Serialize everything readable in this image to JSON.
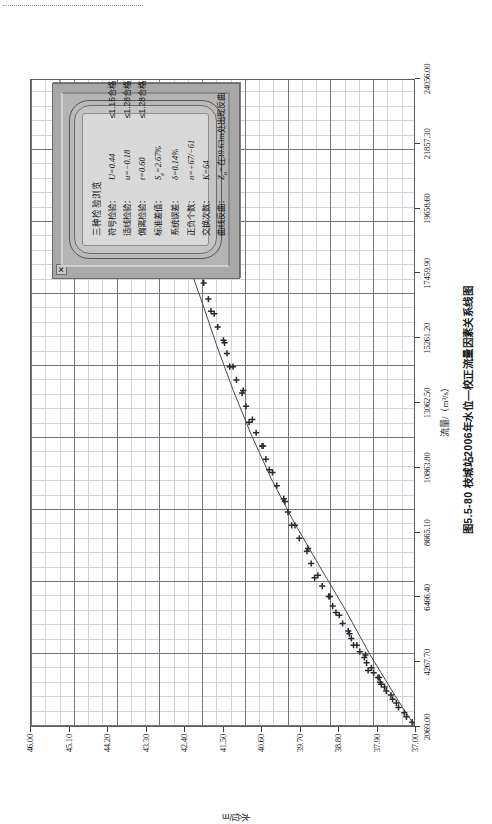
{
  "figure": {
    "caption": "图5.5-80  枝城站2006年水位—校正流量因素关系线图",
    "x_axis_title": "流量/（m³/s）",
    "y_axis_title": "水位/m"
  },
  "dialog": {
    "close_label": "✕",
    "title": "三种检验浏览",
    "rows": [
      {
        "label": "符号检验：",
        "value": "U=0.44",
        "criterion": "≤1.15合格"
      },
      {
        "label": "适线检验：",
        "value": "u=−0.18",
        "criterion": "≤1.28合格"
      },
      {
        "label": "偏离检验：",
        "value": "t=0.60",
        "criterion": "≤1.28合格"
      },
      {
        "label": "标准差值：",
        "value": "Se=2.67%",
        "criterion": ""
      },
      {
        "label": "系统误差：",
        "value": "δ=0.14%",
        "criterion": ""
      },
      {
        "label": "正负个数：",
        "value": "n=+67/−61",
        "criterion": ""
      },
      {
        "label": "交换次数：",
        "value": "K=64",
        "criterion": ""
      },
      {
        "label": "曲线反曲：",
        "value": "Zo=在39.63m处出现反曲",
        "criterion": ""
      }
    ]
  },
  "chart_data": {
    "type": "scatter",
    "title": "图5.5-80  枝城站2006年水位—校正流量因素关系线图",
    "xlabel": "流量/（m³/s）",
    "ylabel": "水位/m",
    "xlim": [
      2069.0,
      24056.0
    ],
    "ylim": [
      37.0,
      46.0
    ],
    "grid": true,
    "legend": null,
    "xticks": [
      "2069.00",
      "4267.70",
      "6466.40",
      "8665.10",
      "10863.80",
      "13062.50",
      "15261.20",
      "17459.90",
      "19658.60",
      "21857.30",
      "24056.00"
    ],
    "yticks": [
      "37.00",
      "37.90",
      "38.80",
      "39.70",
      "40.60",
      "41.50",
      "42.40",
      "43.30",
      "44.20",
      "45.10",
      "46.00"
    ],
    "series": [
      {
        "name": "实测点",
        "marker": "plus",
        "points_x": [
          2200,
          2380,
          2520,
          2700,
          2850,
          2980,
          3120,
          3260,
          3400,
          3560,
          3720,
          3880,
          4050,
          4220,
          4400,
          4600,
          4820,
          5050,
          5300,
          5560,
          5840,
          6150,
          6480,
          6830,
          7200,
          7600,
          8020,
          8460,
          8900,
          9350,
          9800,
          10250,
          10700,
          11150,
          11600,
          12050,
          12500,
          12950,
          13400,
          13850,
          14300,
          14750,
          15200,
          15650,
          16100,
          16600,
          17150,
          17750,
          18400,
          19100,
          19900,
          20800,
          21900
        ],
        "points_y": [
          37.08,
          37.18,
          37.26,
          37.36,
          37.44,
          37.51,
          37.58,
          37.65,
          37.72,
          37.8,
          37.88,
          37.95,
          38.03,
          38.11,
          38.19,
          38.28,
          38.38,
          38.47,
          38.57,
          38.68,
          38.79,
          38.91,
          39.03,
          39.15,
          39.28,
          39.42,
          39.55,
          39.69,
          39.82,
          39.96,
          40.09,
          40.22,
          40.35,
          40.47,
          40.59,
          40.71,
          40.83,
          40.94,
          41.06,
          41.17,
          41.28,
          41.39,
          41.5,
          41.6,
          41.71,
          41.83,
          41.97,
          42.12,
          42.29,
          42.49,
          42.73,
          43.01,
          43.4
        ]
      }
    ],
    "fit_curve": {
      "name": "拟合关系曲线",
      "x": [
        2069,
        3000,
        4500,
        6000,
        7500,
        9000,
        10500,
        12000,
        13500,
        15000,
        16500,
        18000,
        19500,
        21000,
        22500,
        24056
      ],
      "y": [
        37.0,
        37.42,
        38.05,
        38.62,
        39.23,
        39.83,
        40.37,
        40.84,
        41.26,
        41.64,
        41.99,
        42.36,
        42.82,
        43.43,
        44.25,
        45.35
      ]
    }
  }
}
